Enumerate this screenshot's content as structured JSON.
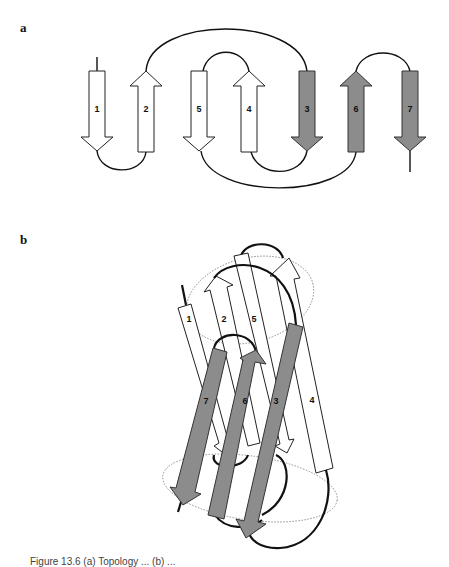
{
  "figure": {
    "panels": [
      {
        "label": "a",
        "description": "Topology diagram of a seven-stranded beta sandwich; strands drawn as arrows in order 1, 2, 5, 4, 3, 6, 7",
        "strand_order_left_to_right": [
          "1",
          "2",
          "5",
          "4",
          "3",
          "6",
          "7"
        ],
        "strands": [
          {
            "id": "1",
            "direction": "down",
            "fill": "white"
          },
          {
            "id": "2",
            "direction": "up",
            "fill": "white"
          },
          {
            "id": "5",
            "direction": "down",
            "fill": "white"
          },
          {
            "id": "4",
            "direction": "up",
            "fill": "white"
          },
          {
            "id": "3",
            "direction": "down",
            "fill": "gray"
          },
          {
            "id": "6",
            "direction": "up",
            "fill": "gray"
          },
          {
            "id": "7",
            "direction": "down",
            "fill": "gray"
          }
        ],
        "connections": [
          {
            "from": "1",
            "to": "2",
            "side": "bottom"
          },
          {
            "from": "2",
            "to": "3",
            "side": "top"
          },
          {
            "from": "3",
            "to": "4",
            "side": "bottom"
          },
          {
            "from": "4",
            "to": "5",
            "side": "top"
          },
          {
            "from": "5",
            "to": "6",
            "side": "bottom"
          },
          {
            "from": "6",
            "to": "7",
            "side": "top"
          }
        ]
      },
      {
        "label": "b",
        "description": "3D schematic of the same beta sandwich: white sheet (1, 2, 5, 4) behind gray sheet (7, 6, 3)",
        "back_sheet": [
          "1",
          "2",
          "5",
          "4"
        ],
        "front_sheet": [
          "7",
          "6",
          "3"
        ]
      }
    ],
    "labels": {
      "panel_a": "a",
      "panel_b": "b",
      "s1": "1",
      "s2": "2",
      "s3": "3",
      "s4": "4",
      "s5": "5",
      "s6": "6",
      "s7": "7"
    },
    "colors": {
      "white_strand": "#ffffff",
      "gray_strand": "#8c8c8c",
      "outline": "#222222",
      "dotted_outline": "#888888"
    },
    "caption_partial": "Figure 13.6   (a) Topology ... (b) ..."
  }
}
